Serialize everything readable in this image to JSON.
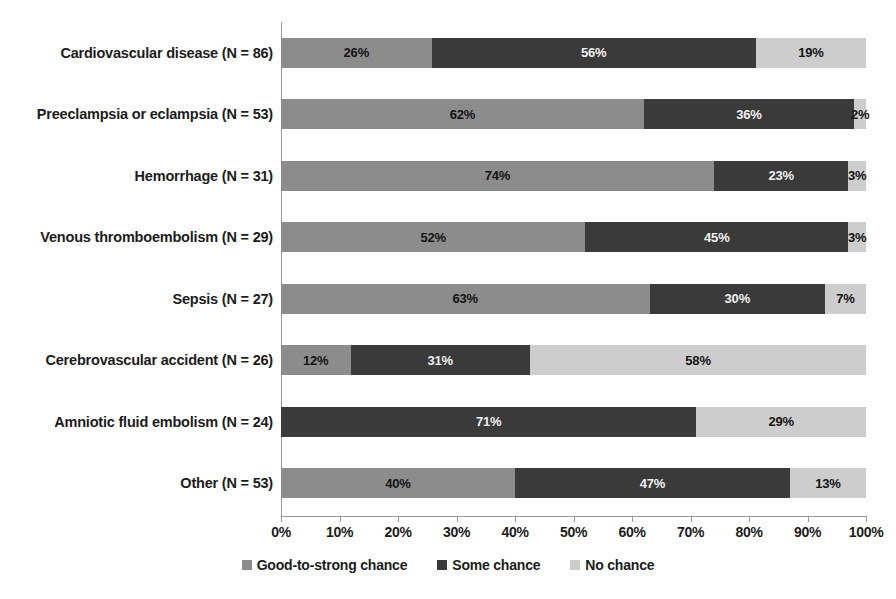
{
  "chart_data": {
    "type": "bar",
    "subtype": "horizontal-100-percent-stacked",
    "title": "",
    "subtitle": "",
    "xlabel": "",
    "ylabel": "",
    "xlim": [
      0,
      100
    ],
    "xtick_labels": [
      "0%",
      "10%",
      "20%",
      "30%",
      "40%",
      "50%",
      "60%",
      "70%",
      "80%",
      "90%",
      "100%"
    ],
    "xtick_values": [
      0,
      10,
      20,
      30,
      40,
      50,
      60,
      70,
      80,
      90,
      100
    ],
    "grid": false,
    "legend_position": "bottom-center",
    "categories": [
      "Cardiovascular disease (N = 86)",
      "Preeclampsia or eclampsia (N = 53)",
      "Hemorrhage (N = 31)",
      "Venous thromboembolism (N = 29)",
      "Sepsis (N = 27)",
      "Cerebrovascular accident (N = 26)",
      "Amniotic fluid embolism (N = 24)",
      "Other (N = 53)"
    ],
    "series": [
      {
        "name": "Good-to-strong chance",
        "color": "#8c8c8c",
        "values": [
          26,
          62,
          74,
          52,
          63,
          12,
          0,
          40
        ],
        "labels": [
          "26%",
          "62%",
          "74%",
          "52%",
          "63%",
          "12%",
          "",
          "40%"
        ]
      },
      {
        "name": "Some chance",
        "color": "#3a3a3a",
        "values": [
          56,
          36,
          23,
          45,
          30,
          31,
          71,
          47
        ],
        "labels": [
          "56%",
          "36%",
          "23%",
          "45%",
          "30%",
          "31%",
          "71%",
          "47%"
        ]
      },
      {
        "name": "No chance",
        "color": "#cdcdcd",
        "values": [
          19,
          2,
          3,
          3,
          7,
          58,
          29,
          13
        ],
        "labels": [
          "19%",
          "2%",
          "3%",
          "3%",
          "7%",
          "58%",
          "29%",
          "13%"
        ]
      }
    ],
    "rows": [
      {
        "label": "Cardiovascular disease (N = 86)",
        "good": 26,
        "some": 56,
        "none": 19,
        "good_label": "26%",
        "some_label": "56%",
        "none_label": "19%"
      },
      {
        "label": "Preeclampsia or eclampsia (N = 53)",
        "good": 62,
        "some": 36,
        "none": 2,
        "good_label": "62%",
        "some_label": "36%",
        "none_label": "2%"
      },
      {
        "label": "Hemorrhage (N = 31)",
        "good": 74,
        "some": 23,
        "none": 3,
        "good_label": "74%",
        "some_label": "23%",
        "none_label": "3%"
      },
      {
        "label": "Venous thromboembolism (N = 29)",
        "good": 52,
        "some": 45,
        "none": 3,
        "good_label": "52%",
        "some_label": "45%",
        "none_label": "3%"
      },
      {
        "label": "Sepsis (N = 27)",
        "good": 63,
        "some": 30,
        "none": 7,
        "good_label": "63%",
        "some_label": "30%",
        "none_label": "7%"
      },
      {
        "label": "Cerebrovascular accident (N = 26)",
        "good": 12,
        "some": 31,
        "none": 58,
        "good_label": "12%",
        "some_label": "31%",
        "none_label": "58%"
      },
      {
        "label": "Amniotic fluid embolism (N = 24)",
        "good": 0,
        "some": 71,
        "none": 29,
        "good_label": "",
        "some_label": "71%",
        "none_label": "29%"
      },
      {
        "label": "Other (N = 53)",
        "good": 40,
        "some": 47,
        "none": 13,
        "good_label": "40%",
        "some_label": "47%",
        "none_label": "13%"
      }
    ],
    "legend": [
      {
        "label": "Good-to-strong chance",
        "color": "#8c8c8c"
      },
      {
        "label": "Some chance",
        "color": "#3a3a3a"
      },
      {
        "label": "No chance",
        "color": "#cdcdcd"
      }
    ],
    "colors": {
      "good_to_strong_chance": "#8c8c8c",
      "some_chance": "#3a3a3a",
      "no_chance": "#cdcdcd",
      "axis": "#9a9a9a",
      "text": "#1c1c1c",
      "background": "#ffffff"
    }
  }
}
